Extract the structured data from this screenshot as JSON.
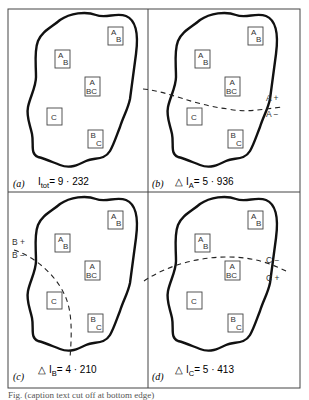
{
  "figure": {
    "panels": [
      {
        "id": "a",
        "label": "(a)",
        "equation": {
          "prefix": "",
          "symbol": "I",
          "subscript": "tot",
          "value": "= 9 · 232"
        },
        "partition": null
      },
      {
        "id": "b",
        "label": "(b)",
        "equation": {
          "prefix": "△",
          "symbol": "I",
          "subscript": "A",
          "value": "= 5 · 936"
        },
        "partition": {
          "variable": "A",
          "labels": [
            "A +",
            "A −"
          ]
        }
      },
      {
        "id": "c",
        "label": "(c)",
        "equation": {
          "prefix": "△",
          "symbol": "I",
          "subscript": "B",
          "value": "= 4 · 210"
        },
        "partition": {
          "variable": "B",
          "labels": [
            "B +",
            "B −"
          ]
        }
      },
      {
        "id": "d",
        "label": "(d)",
        "equation": {
          "prefix": "△",
          "symbol": "I",
          "subscript": "C",
          "value": "= 5 · 413"
        },
        "partition": {
          "variable": "C",
          "labels": [
            "C −",
            "C +"
          ]
        }
      }
    ],
    "boxes": [
      {
        "name": "box-ab-top-right",
        "top": "A",
        "bottom": "B"
      },
      {
        "name": "box-ab-left",
        "top": "A",
        "bottom": "B"
      },
      {
        "name": "box-abc",
        "top": "A",
        "bottom": "BC"
      },
      {
        "name": "box-c",
        "top": "C",
        "bottom": ""
      },
      {
        "name": "box-bc",
        "top": "B",
        "bottom": "C"
      }
    ],
    "caption": "Fig. (caption text cut off at bottom edge)"
  }
}
